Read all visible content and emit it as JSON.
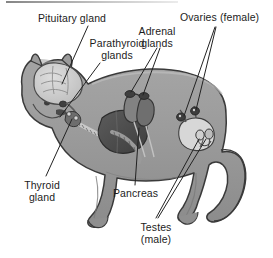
{
  "figure": {
    "view": "lateral whole-body cutaway",
    "style": "grayscale line drawing",
    "colors": {
      "background": "#ffffff",
      "body_fill": "#9b9b9b",
      "body_shade": "#8a8a8a",
      "body_highlight": "#b3b3b3",
      "outline": "#3a3a3a",
      "brain_fill": "#cfcfcf",
      "organ_dark": "#4a4a4a",
      "organ_mid": "#7d7d7d",
      "organ_light": "#d2d2d2",
      "leader_line": "#222222",
      "text": "#1c1c1c",
      "top_rule": "#6f6f6f"
    }
  },
  "labels": [
    {
      "id": "pituitary",
      "text": "Pituitary gland",
      "lines": [
        "Pituitary gland"
      ],
      "x": 38,
      "y": 13,
      "align": "left",
      "target": "brain-base"
    },
    {
      "id": "parathyroid",
      "text": "Parathyroid glands",
      "lines": [
        "Parathyroid",
        "glands"
      ],
      "x": 74,
      "y": 38,
      "align": "center",
      "target": "throat"
    },
    {
      "id": "adrenal",
      "text": "Adrenal glands",
      "lines": [
        "Adrenal",
        "glands"
      ],
      "x": 126,
      "y": 26,
      "align": "center",
      "target": "kidney-top"
    },
    {
      "id": "ovaries",
      "text": "Ovaries (female)",
      "lines": [
        "Ovaries (female)"
      ],
      "x": 180,
      "y": 12,
      "align": "left",
      "target": "ovary-pair"
    },
    {
      "id": "thyroid",
      "text": "Thyroid gland",
      "lines": [
        "Thyroid",
        "gland"
      ],
      "x": 14,
      "y": 180,
      "align": "left",
      "target": "throat"
    },
    {
      "id": "pancreas",
      "text": "Pancreas",
      "lines": [
        "Pancreas"
      ],
      "x": 113,
      "y": 188,
      "align": "left",
      "target": "abdomen"
    },
    {
      "id": "testes",
      "text": "Testes (male)",
      "lines": [
        "Testes",
        "(male)"
      ],
      "x": 134,
      "y": 222,
      "align": "left",
      "target": "testis-pair"
    }
  ],
  "leader_lines": [
    {
      "id": "leader-pituitary",
      "label": "pituitary",
      "points": "88,26 62,84"
    },
    {
      "id": "leader-parathyroid",
      "label": "parathyroid",
      "points": "100,63 60,117"
    },
    {
      "id": "leader-adrenal-1",
      "label": "adrenal",
      "points": "157,48 131,92"
    },
    {
      "id": "leader-adrenal-2",
      "label": "adrenal",
      "points": "160,48 142,96"
    },
    {
      "id": "leader-ovaries-1",
      "label": "ovaries",
      "points": "215,27 185,118"
    },
    {
      "id": "leader-ovaries-2",
      "label": "ovaries",
      "points": "216,27 196,112"
    },
    {
      "id": "leader-thyroid",
      "label": "thyroid",
      "points": "46,176 72,120"
    },
    {
      "id": "leader-pancreas",
      "label": "pancreas",
      "points": "135,185 139,128"
    },
    {
      "id": "leader-testes-1",
      "label": "testes",
      "points": "156,218 198,136"
    },
    {
      "id": "leader-testes-2",
      "label": "testes",
      "points": "158,218 204,136"
    }
  ],
  "organs": [
    {
      "id": "brain",
      "name": "brain",
      "tone": "light"
    },
    {
      "id": "pituitary",
      "name": "pituitary gland",
      "tone": "dark"
    },
    {
      "id": "thyroid",
      "name": "thyroid gland",
      "tone": "mid"
    },
    {
      "id": "parathyroid",
      "name": "parathyroid glands",
      "tone": "mid"
    },
    {
      "id": "liver",
      "name": "liver",
      "tone": "dark"
    },
    {
      "id": "kidneys",
      "name": "kidneys",
      "tone": "mid"
    },
    {
      "id": "adrenals",
      "name": "adrenal glands",
      "tone": "dark"
    },
    {
      "id": "pancreas",
      "name": "pancreas",
      "tone": "mid"
    },
    {
      "id": "uterus",
      "name": "uterus",
      "tone": "light"
    },
    {
      "id": "ovaries",
      "name": "ovaries",
      "tone": "dark"
    },
    {
      "id": "testes",
      "name": "testes",
      "tone": "light"
    }
  ]
}
